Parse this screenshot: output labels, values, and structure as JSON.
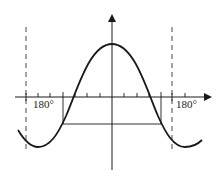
{
  "diagram": {
    "type": "cosine-graph",
    "x_labels": {
      "left": "180°",
      "right": "180°"
    },
    "x_axis": {
      "y": 97,
      "x_start": 15,
      "x_end": 212
    },
    "y_axis": {
      "x": 112,
      "y_start": 170,
      "y_end": 14
    },
    "asymptotes_dashed": [
      26,
      172
    ],
    "ticks_x": [
      26,
      38,
      50,
      63,
      75,
      87,
      100,
      124,
      137,
      149,
      161,
      172,
      185
    ],
    "curve": {
      "peak": [
        112,
        44
      ],
      "trough_left": [
        38,
        147
      ],
      "trough_right": [
        185,
        147
      ]
    },
    "horizontal_segment": {
      "y": 124,
      "x1": 63,
      "x2": 161
    },
    "stroke_color": "#1a1a1a"
  }
}
